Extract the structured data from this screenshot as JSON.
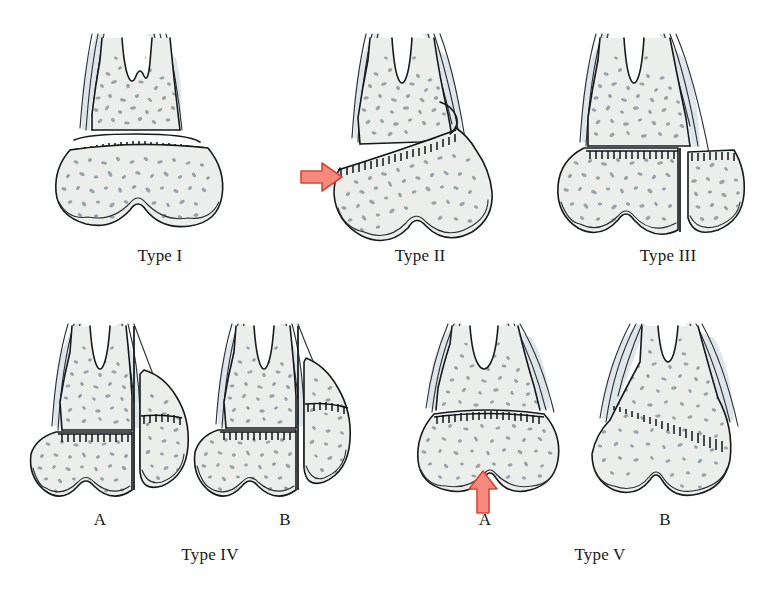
{
  "figure": {
    "background_color": "#ffffff",
    "ink_color": "#16191c",
    "cortex_color": "#dfe6ea",
    "spongy_color": "#eceeec",
    "speckle_color": "#9aa3a9",
    "arrow_fill_color": "#f4897c",
    "arrow_stroke_color": "#d9453a"
  },
  "rows": [
    {
      "id": "row-top",
      "panels": [
        {
          "id": "type-1",
          "label": "Type I",
          "sublabel": "",
          "fracture": "transverse separation through the growth plate only",
          "has_arrow": false,
          "arrow_direction": ""
        },
        {
          "id": "type-2",
          "label": "Type II",
          "sublabel": "",
          "fracture": "through growth plate with a metaphyseal wedge fragment",
          "has_arrow": true,
          "arrow_direction": "right"
        },
        {
          "id": "type-3",
          "label": "Type III",
          "sublabel": "",
          "fracture": "through growth plate and down into the epiphysis",
          "has_arrow": false,
          "arrow_direction": ""
        }
      ]
    },
    {
      "id": "row-bottom",
      "groups": [
        {
          "id": "type-4",
          "label": "Type IV",
          "panels": [
            {
              "id": "type-4-a",
              "label": "A",
              "fracture": "vertical split crossing metaphysis, physis and epiphysis",
              "has_arrow": false,
              "arrow_direction": ""
            },
            {
              "id": "type-4-b",
              "label": "B",
              "fracture": "vertical split with displaced lateral fragment",
              "has_arrow": false,
              "arrow_direction": ""
            }
          ]
        },
        {
          "id": "type-5",
          "label": "Type V",
          "panels": [
            {
              "id": "type-5-a",
              "label": "A",
              "fracture": "axial compression crush of the growth plate",
              "has_arrow": true,
              "arrow_direction": "up"
            },
            {
              "id": "type-5-b",
              "label": "B",
              "fracture": "oblique crush injury of the growth plate",
              "has_arrow": false,
              "arrow_direction": ""
            }
          ]
        }
      ]
    }
  ]
}
